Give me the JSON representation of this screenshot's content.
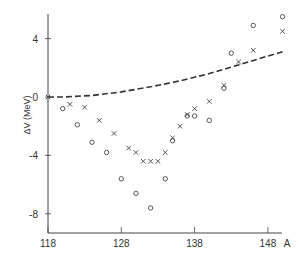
{
  "chart_data": {
    "type": "scatter",
    "title": "",
    "xlabel": "A",
    "ylabel": "ΔV (MeV)",
    "xlim": [
      118,
      152
    ],
    "ylim": [
      -9.5,
      6.5
    ],
    "x_ticks": [
      118,
      128,
      138,
      148
    ],
    "y_ticks": [
      4,
      0,
      -4,
      -8
    ],
    "grid": false,
    "legend": null,
    "series": [
      {
        "name": "crosses",
        "marker": "x",
        "points": [
          [
            118,
            0.0
          ],
          [
            121,
            -0.5
          ],
          [
            123,
            -0.7
          ],
          [
            125,
            -1.6
          ],
          [
            127,
            -2.5
          ],
          [
            129,
            -3.5
          ],
          [
            130,
            -3.8
          ],
          [
            131,
            -4.4
          ],
          [
            132,
            -4.4
          ],
          [
            133,
            -4.4
          ],
          [
            134,
            -3.8
          ],
          [
            135,
            -2.8
          ],
          [
            136,
            -2.0
          ],
          [
            137,
            -1.2
          ],
          [
            138,
            -0.8
          ],
          [
            140,
            -0.3
          ],
          [
            142,
            0.8
          ],
          [
            144,
            2.4
          ],
          [
            146,
            3.2
          ],
          [
            150,
            4.5
          ]
        ]
      },
      {
        "name": "circles",
        "marker": "o",
        "points": [
          [
            120,
            -0.8
          ],
          [
            122,
            -1.9
          ],
          [
            124,
            -3.1
          ],
          [
            126,
            -3.8
          ],
          [
            128,
            -5.6
          ],
          [
            130,
            -6.6
          ],
          [
            132,
            -7.6
          ],
          [
            134,
            -5.6
          ],
          [
            135,
            -3.0
          ],
          [
            137,
            -1.3
          ],
          [
            138,
            -1.3
          ],
          [
            140,
            -1.6
          ],
          [
            142,
            0.6
          ],
          [
            143,
            3.0
          ],
          [
            146,
            4.9
          ],
          [
            150,
            5.5
          ]
        ]
      },
      {
        "name": "dashed curve",
        "marker": "line",
        "style": "dashed",
        "points": [
          [
            118,
            0.0
          ],
          [
            120,
            0.0
          ],
          [
            124,
            0.1
          ],
          [
            128,
            0.35
          ],
          [
            132,
            0.7
          ],
          [
            136,
            1.1
          ],
          [
            140,
            1.6
          ],
          [
            144,
            2.2
          ],
          [
            148,
            2.8
          ],
          [
            150,
            3.1
          ]
        ]
      }
    ]
  }
}
